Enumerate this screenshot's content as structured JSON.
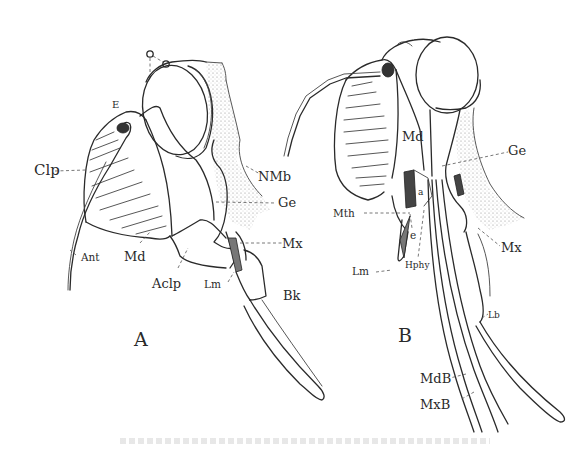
{
  "figure": {
    "panels": [
      {
        "id": "A",
        "panel_label": "A",
        "labels": {
          "ocellus": "O",
          "eye": "E",
          "clypeus": "Clp",
          "neck_membrane": "NMb",
          "gena": "Ge",
          "maxilla": "Mx",
          "antenna": "Ant",
          "mandible": "Md",
          "anteclypeus": "Aclp",
          "labrum": "Lm",
          "beak": "Bk"
        }
      },
      {
        "id": "B",
        "panel_label": "B",
        "labels": {
          "mandible": "Md",
          "gena": "Ge",
          "apodeme": "a",
          "mouth": "Mth",
          "epipharynx": "e",
          "labrum": "Lm",
          "hypopharynx": "Hphy",
          "maxilla": "Mx",
          "labium": "Lb",
          "mandibular_bristle": "MdB",
          "maxillary_bristle": "MxB"
        }
      }
    ],
    "caption": ""
  }
}
